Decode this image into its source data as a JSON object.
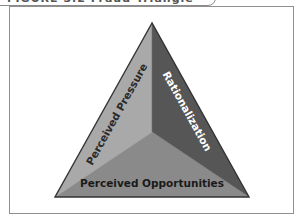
{
  "figure": {
    "title": "FIGURE 3.2 Fraud Triangle"
  },
  "diagram": {
    "type": "fraud-triangle",
    "faces": [
      {
        "id": "left",
        "label": "Perceived Pressure",
        "fill": "#a9a9a9",
        "text_color": "#2a2a2a"
      },
      {
        "id": "right",
        "label": "Rationalization",
        "fill": "#565656",
        "text_color": "#ffffff"
      },
      {
        "id": "bottom",
        "label": "Perceived Opportunities",
        "fill": "#8a8a8a",
        "text_color": "#1a1a1a"
      }
    ],
    "outline_color": "#333333",
    "frame_color": "#8f8f8f"
  }
}
